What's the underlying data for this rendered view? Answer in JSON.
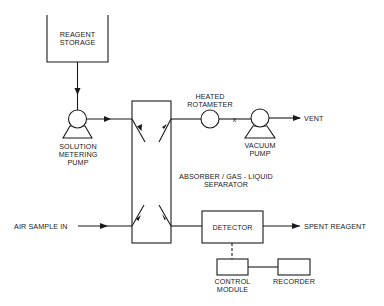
{
  "diagram": {
    "type": "process-flow",
    "components": {
      "reagent_storage": {
        "lines": [
          "REAGENT",
          "STORAGE"
        ]
      },
      "metering_pump": {
        "lines": [
          "SOLUTION",
          "METERING",
          "PUMP"
        ]
      },
      "absorber": {
        "lines": [
          "ABSORBER / GAS - LIQUID",
          "SEPARATOR"
        ]
      },
      "rotameter": {
        "lines": [
          "HEATED",
          "ROTAMETER"
        ]
      },
      "vacuum_pump": {
        "lines": [
          "VACUUM",
          "PUMP"
        ]
      },
      "detector": {
        "label": "DETECTOR"
      },
      "control_module": {
        "lines": [
          "CONTROL",
          "MODULE"
        ]
      },
      "recorder": {
        "label": "RECORDER"
      }
    },
    "terminals": {
      "vent": "VENT",
      "spent_reagent": "SPENT  REAGENT",
      "air_sample_in": "AIR  SAMPLE  IN"
    },
    "valve_mark": "x",
    "edges": [
      {
        "from": "reagent_storage",
        "to": "metering_pump",
        "style": "solid",
        "arrow": true
      },
      {
        "from": "metering_pump",
        "to": "absorber",
        "style": "solid",
        "arrow": true
      },
      {
        "from": "absorber",
        "to": "rotameter",
        "style": "solid",
        "arrow": false
      },
      {
        "from": "rotameter",
        "to": "vacuum_pump",
        "style": "solid",
        "marker": "x"
      },
      {
        "from": "vacuum_pump",
        "to": "vent",
        "style": "solid",
        "arrow": true
      },
      {
        "from": "air_sample_in",
        "to": "absorber",
        "style": "solid",
        "arrow": true
      },
      {
        "from": "absorber",
        "to": "detector",
        "style": "solid",
        "arrow": false
      },
      {
        "from": "detector",
        "to": "spent_reagent",
        "style": "solid",
        "arrow": true
      },
      {
        "from": "detector",
        "to": "control_module",
        "style": "dashed",
        "arrow": false
      },
      {
        "from": "control_module",
        "to": "recorder",
        "style": "solid",
        "arrow": false
      }
    ],
    "colors": {
      "ink": "#1a1a1a",
      "background": "#ffffff"
    }
  }
}
